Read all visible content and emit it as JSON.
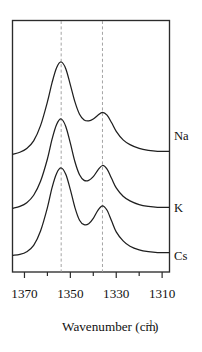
{
  "figure": {
    "background_color": "#ffffff",
    "curve_color": "#1f1f1f",
    "frame_color": "#2b2b2b",
    "guide_color": "#9a9a9a"
  },
  "chart_data": {
    "type": "line",
    "title": "",
    "subtitle": "",
    "xlabel_text": "Wavenumber (cm",
    "xlabel_superscript": "-1",
    "xlabel_closing": ")",
    "xlabel_full": "Wavenumber (cm-1)",
    "ylabel": "",
    "xlim": [
      1375,
      1307
    ],
    "x_axis_direction": "decreasing",
    "grid": false,
    "legend_position": "right-inline",
    "tick_labels": [
      "1370",
      "1350",
      "1330",
      "1310"
    ],
    "tick_values": [
      1370,
      1350,
      1330,
      1310
    ],
    "minor_tick_values": [
      1360,
      1340,
      1320
    ],
    "annotations": [
      {
        "name": "guide-line-left",
        "x": 1354,
        "style": "dashed-vertical"
      },
      {
        "name": "guide-line-right",
        "x": 1336,
        "style": "dashed-vertical"
      }
    ],
    "series": [
      {
        "name": "Na",
        "label": "Na",
        "offset_rank": 0,
        "peaks": [
          {
            "x": 1354,
            "relative_height": 1.0
          },
          {
            "x": 1336,
            "relative_height": 0.42
          }
        ],
        "x": [
          1375,
          1372,
          1369,
          1366,
          1363,
          1360,
          1358,
          1356,
          1354,
          1352,
          1350,
          1348,
          1346,
          1344,
          1342,
          1340,
          1338,
          1336,
          1334,
          1332,
          1330,
          1327,
          1324,
          1320,
          1316,
          1312,
          1307
        ],
        "y": [
          0.03,
          0.05,
          0.09,
          0.17,
          0.33,
          0.58,
          0.78,
          0.94,
          1.0,
          0.93,
          0.76,
          0.58,
          0.45,
          0.39,
          0.38,
          0.4,
          0.44,
          0.47,
          0.44,
          0.36,
          0.27,
          0.18,
          0.13,
          0.09,
          0.07,
          0.06,
          0.06
        ]
      },
      {
        "name": "K",
        "label": "K",
        "offset_rank": 1,
        "peaks": [
          {
            "x": 1354,
            "relative_height": 1.0
          },
          {
            "x": 1336,
            "relative_height": 0.46
          }
        ],
        "x": [
          1375,
          1372,
          1369,
          1366,
          1363,
          1360,
          1358,
          1356,
          1354,
          1352,
          1350,
          1348,
          1346,
          1344,
          1342,
          1340,
          1338,
          1336,
          1334,
          1332,
          1330,
          1327,
          1324,
          1320,
          1316,
          1312,
          1307
        ],
        "y": [
          0.04,
          0.06,
          0.1,
          0.18,
          0.33,
          0.57,
          0.78,
          0.94,
          1.0,
          0.92,
          0.74,
          0.54,
          0.4,
          0.34,
          0.34,
          0.38,
          0.45,
          0.5,
          0.46,
          0.36,
          0.26,
          0.17,
          0.12,
          0.08,
          0.06,
          0.05,
          0.05
        ]
      },
      {
        "name": "Cs",
        "label": "Cs",
        "offset_rank": 2,
        "peaks": [
          {
            "x": 1354,
            "relative_height": 1.0
          },
          {
            "x": 1336,
            "relative_height": 0.55
          }
        ],
        "x": [
          1375,
          1372,
          1369,
          1366,
          1363,
          1360,
          1358,
          1356,
          1354,
          1352,
          1350,
          1348,
          1346,
          1344,
          1342,
          1340,
          1338,
          1336,
          1334,
          1332,
          1330,
          1327,
          1324,
          1320,
          1316,
          1312,
          1307
        ],
        "y": [
          0.03,
          0.04,
          0.07,
          0.14,
          0.3,
          0.56,
          0.78,
          0.94,
          1.0,
          0.93,
          0.76,
          0.56,
          0.42,
          0.37,
          0.38,
          0.44,
          0.53,
          0.58,
          0.53,
          0.41,
          0.29,
          0.19,
          0.13,
          0.09,
          0.07,
          0.06,
          0.06
        ]
      }
    ]
  },
  "axis": {
    "x_ticks": [
      {
        "label": "1370",
        "value": 1370
      },
      {
        "label": "1350",
        "value": 1350
      },
      {
        "label": "1330",
        "value": 1330
      },
      {
        "label": "1310",
        "value": 1310
      }
    ],
    "title_main": "Wavenumber (cm",
    "title_sup": "-1",
    "title_end": ")"
  },
  "labels": {
    "na": "Na",
    "k": "K",
    "cs": "Cs"
  }
}
